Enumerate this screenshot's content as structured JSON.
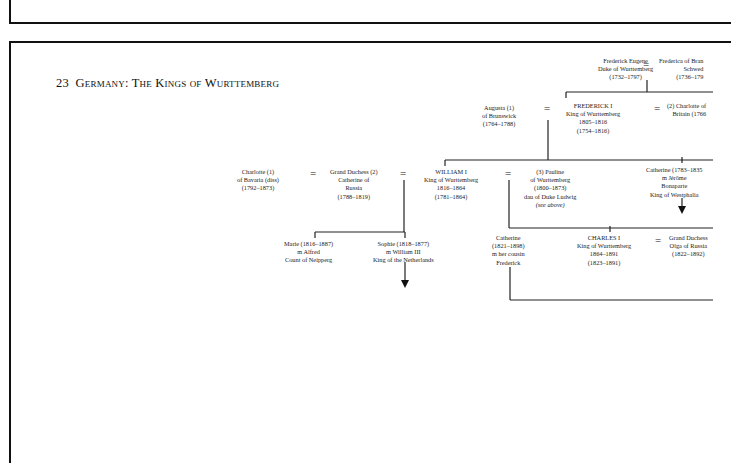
{
  "title": {
    "number": "23",
    "text": "Germany: The Kings of Wurttemberg"
  },
  "marriage_symbol": "=",
  "people": {
    "frederick_eugene": [
      "Frederick Eugene",
      "Duke of Wurttemberg",
      "(1732–1797)"
    ],
    "frederica": [
      "Frederica of Bran",
      "Schwed",
      "(1736–179"
    ],
    "augusta": [
      "Augusta (1)",
      "of Brunswick",
      "(1764–1788)"
    ],
    "frederick_i": [
      "FREDERICK I",
      "King of Wurttemberg",
      "1805–1816",
      "(1754–1816)"
    ],
    "charlotte_britain": [
      "(2)  Charlotte of",
      "Britain (1766"
    ],
    "charlotte_bavaria": [
      "Charlotte (1)",
      "of Bavaria    (diss)",
      "(1792–1873)"
    ],
    "catherine_russia": [
      "Grand Duchess (2)",
      "Catherine of",
      "Russia",
      "(1788–1819)"
    ],
    "william_i": [
      "WILLIAM I",
      "King of Wurttemberg",
      "1816–1864",
      "(1781–1864)"
    ],
    "pauline": [
      "(3) Pauline",
      "of Wurttemberg",
      "(1800–1873)",
      "dau of Duke Ludwig",
      "(see above)"
    ],
    "catherine_westphalia": [
      "Catherine (1783–1835",
      "m Jérôme",
      "Bonaparte",
      "King of Westphalia"
    ],
    "marie": [
      "Marie (1816–1887)",
      "m Alfred",
      "Count of Neipperg"
    ],
    "sophie": [
      "Sophie (1818–1877)",
      "m William III",
      "King of the Netherlands"
    ],
    "catherine_1821": [
      "Catherine",
      "(1821–1898)",
      "m her cousin",
      "Frederick"
    ],
    "charles_i": [
      "CHARLES I",
      "King of Wurttemberg",
      "1864–1891",
      "(1823–1891)"
    ],
    "olga": [
      "Grand Duchess",
      "Olga of Russia",
      "(1822–1892)"
    ]
  }
}
